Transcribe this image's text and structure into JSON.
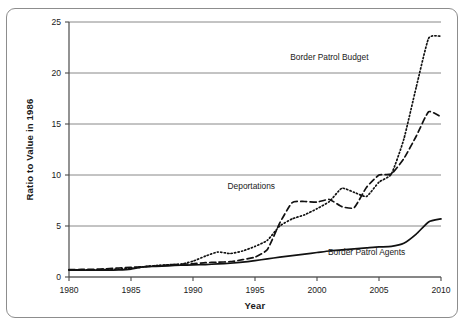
{
  "chart_data": {
    "type": "line",
    "title": "",
    "xlabel": "Year",
    "ylabel": "Ratio to Value in 1986",
    "xlim": [
      1980,
      2010
    ],
    "ylim": [
      0,
      25
    ],
    "xticks": [
      1980,
      1985,
      1990,
      1995,
      2000,
      2005,
      2010
    ],
    "yticks": [
      0,
      5,
      10,
      15,
      20,
      25
    ],
    "xtick_labels": [
      "1980",
      "1985",
      "1990",
      "1995",
      "2000",
      "2005",
      "2010"
    ],
    "ytick_labels": [
      "0",
      "5",
      "10",
      "15",
      "20",
      "25"
    ],
    "grid": "horizontal",
    "legend_position": "inline-annotations",
    "x": [
      1980,
      1981,
      1982,
      1983,
      1984,
      1985,
      1986,
      1987,
      1988,
      1989,
      1990,
      1991,
      1992,
      1993,
      1994,
      1995,
      1996,
      1997,
      1998,
      1999,
      2000,
      2001,
      2002,
      2003,
      2004,
      2005,
      2006,
      2007,
      2008,
      2009,
      2010
    ],
    "series": [
      {
        "name": "Border Patrol Budget",
        "style": "dotted",
        "color": "#111111",
        "label": "Border Patrol Budget",
        "values": [
          0.7,
          0.7,
          0.7,
          0.72,
          0.78,
          0.85,
          1.0,
          1.12,
          1.2,
          1.25,
          1.55,
          2.05,
          2.45,
          2.3,
          2.55,
          3.0,
          3.6,
          5.0,
          5.7,
          6.1,
          6.7,
          7.4,
          8.7,
          8.3,
          7.9,
          9.3,
          10.1,
          13.5,
          18.6,
          23.4,
          23.6
        ]
      },
      {
        "name": "Deportations",
        "style": "dashed",
        "color": "#111111",
        "label": "Deportations",
        "values": [
          0.72,
          0.74,
          0.76,
          0.8,
          0.88,
          0.95,
          1.0,
          1.08,
          1.2,
          1.25,
          1.3,
          1.4,
          1.45,
          1.5,
          1.7,
          1.95,
          2.7,
          5.3,
          7.3,
          7.4,
          7.35,
          7.6,
          6.9,
          6.8,
          8.8,
          10.0,
          10.1,
          11.6,
          13.8,
          16.2,
          15.7
        ]
      },
      {
        "name": "Border Patrol Agents",
        "style": "solid",
        "color": "#111111",
        "label": "Border Patrol Agents",
        "values": [
          0.68,
          0.68,
          0.68,
          0.68,
          0.7,
          0.78,
          1.0,
          1.05,
          1.1,
          1.15,
          1.18,
          1.22,
          1.28,
          1.35,
          1.45,
          1.6,
          1.78,
          1.95,
          2.1,
          2.25,
          2.4,
          2.55,
          2.65,
          2.75,
          2.85,
          2.95,
          3.0,
          3.3,
          4.2,
          5.4,
          5.7
        ]
      }
    ],
    "annotations": [
      {
        "text": "Border Patrol Budget",
        "x": 2001.0,
        "y": 21.3
      },
      {
        "text": "Deportations",
        "x": 1994.7,
        "y": 8.6
      },
      {
        "text": "Border Patrol Agents",
        "x": 2004.0,
        "y": 2.2
      }
    ]
  }
}
